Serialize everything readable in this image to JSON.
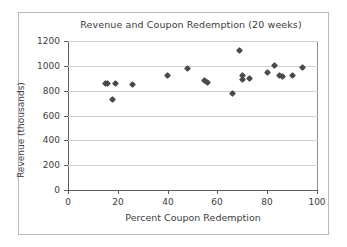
{
  "chart_data": {
    "type": "scatter",
    "title": "Revenue and Coupon Redemption (20 weeks)",
    "xlabel": "Percent Coupon Redemption",
    "ylabel": "Revenue (thousands)",
    "xlim": [
      0,
      100
    ],
    "ylim": [
      0,
      1200
    ],
    "xticks": [
      0,
      20,
      40,
      60,
      80,
      100
    ],
    "yticks": [
      0,
      200,
      400,
      600,
      800,
      1000,
      1200
    ],
    "xtick_labels": [
      "0",
      "20",
      "40",
      "60",
      "80",
      "100"
    ],
    "ytick_labels": [
      "0",
      "200",
      "400",
      "600",
      "800",
      "1000",
      "1200"
    ],
    "grid": "horizontal",
    "legend": "none",
    "marker": "diamond",
    "marker_color": "#4a4a4a",
    "n_points": 20,
    "points": [
      {
        "x": 15,
        "y": 860
      },
      {
        "x": 16,
        "y": 855
      },
      {
        "x": 18,
        "y": 725
      },
      {
        "x": 19,
        "y": 855
      },
      {
        "x": 26,
        "y": 850
      },
      {
        "x": 40,
        "y": 920
      },
      {
        "x": 48,
        "y": 980
      },
      {
        "x": 55,
        "y": 885
      },
      {
        "x": 56,
        "y": 865
      },
      {
        "x": 66,
        "y": 780
      },
      {
        "x": 69,
        "y": 1120
      },
      {
        "x": 70,
        "y": 920
      },
      {
        "x": 70,
        "y": 890
      },
      {
        "x": 73,
        "y": 900
      },
      {
        "x": 80,
        "y": 945
      },
      {
        "x": 83,
        "y": 1005
      },
      {
        "x": 85,
        "y": 920
      },
      {
        "x": 86,
        "y": 915
      },
      {
        "x": 90,
        "y": 925
      },
      {
        "x": 94,
        "y": 990
      }
    ]
  }
}
